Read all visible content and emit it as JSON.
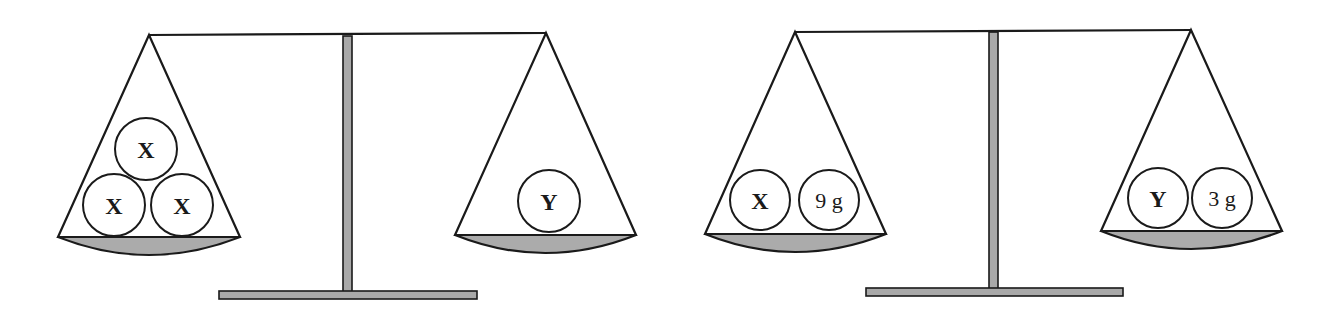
{
  "scales": [
    {
      "id": "scale-1",
      "left_pan": {
        "weights": [
          {
            "label": "X",
            "type": "variable"
          },
          {
            "label": "X",
            "type": "variable"
          },
          {
            "label": "X",
            "type": "variable"
          }
        ]
      },
      "right_pan": {
        "weights": [
          {
            "label": "Y",
            "type": "variable"
          }
        ]
      },
      "state": "balanced"
    },
    {
      "id": "scale-2",
      "left_pan": {
        "weights": [
          {
            "label": "X",
            "type": "variable"
          },
          {
            "label": "9 g",
            "type": "mass"
          }
        ]
      },
      "right_pan": {
        "weights": [
          {
            "label": "Y",
            "type": "variable"
          },
          {
            "label": "3 g",
            "type": "mass"
          }
        ]
      },
      "state": "balanced"
    }
  ],
  "colors": {
    "stroke": "#1a1a1a",
    "pan_fill": "#ababab",
    "pole_fill": "#a9a9a9",
    "background": "#ffffff"
  }
}
